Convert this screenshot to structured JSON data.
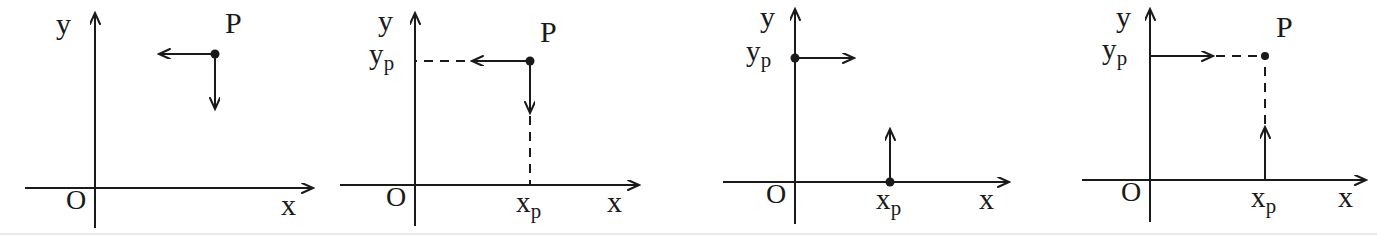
{
  "figure": {
    "background_color": "#ffffff",
    "stroke_color": "#1a1a1a",
    "panel_count": 4
  },
  "labels": {
    "x_axis": "x",
    "y_axis": "y",
    "origin": "O",
    "point": "P",
    "x_sub": "x",
    "x_sub_index": "p",
    "y_sub": "y",
    "y_sub_index": "p"
  },
  "panels": [
    {
      "id": "panel-1",
      "name": "point-p-with-component-arrows",
      "x_axis_label": "x",
      "y_axis_label": "y",
      "origin_label": "O",
      "point_label": "P",
      "has_x_projection_label": false,
      "has_y_projection_label": false,
      "arrows": [
        {
          "name": "leftward-arrow-from-p",
          "direction": "left",
          "style": "solid"
        },
        {
          "name": "downward-arrow-from-p",
          "direction": "down",
          "style": "solid"
        }
      ],
      "dot": {
        "name": "point-p-dot",
        "on": "free-point"
      }
    },
    {
      "id": "panel-2",
      "name": "point-p-projecting-onto-axes",
      "x_axis_label": "x",
      "y_axis_label": "y",
      "origin_label": "O",
      "point_label": "P",
      "x_projection_label": "x",
      "x_projection_sub": "p",
      "y_projection_label": "y",
      "y_projection_sub": "p",
      "has_x_projection_label": true,
      "has_y_projection_label": true,
      "arrows": [
        {
          "name": "leftward-arrow-to-y-axis",
          "direction": "left",
          "style": "solid-then-dashed"
        },
        {
          "name": "downward-arrow-to-x-axis",
          "direction": "down",
          "style": "solid-then-dashed"
        }
      ],
      "dot": {
        "name": "point-p-dot",
        "on": "free-point"
      }
    },
    {
      "id": "panel-3",
      "name": "axis-points-with-outward-arrows",
      "x_axis_label": "x",
      "y_axis_label": "y",
      "origin_label": "O",
      "x_projection_label": "x",
      "x_projection_sub": "p",
      "y_projection_label": "y",
      "y_projection_sub": "p",
      "has_x_projection_label": true,
      "has_y_projection_label": true,
      "has_point_label": false,
      "arrows": [
        {
          "name": "rightward-arrow-from-y-axis",
          "direction": "right",
          "style": "solid"
        },
        {
          "name": "upward-arrow-from-x-axis",
          "direction": "up",
          "style": "solid"
        }
      ],
      "dots": [
        {
          "name": "y-projection-dot",
          "on": "y-axis"
        },
        {
          "name": "x-projection-dot",
          "on": "x-axis"
        }
      ]
    },
    {
      "id": "panel-4",
      "name": "axis-projections-reconstructing-p",
      "x_axis_label": "x",
      "y_axis_label": "y",
      "origin_label": "O",
      "point_label": "P",
      "x_projection_label": "x",
      "x_projection_sub": "p",
      "y_projection_label": "y",
      "y_projection_sub": "p",
      "has_x_projection_label": true,
      "has_y_projection_label": true,
      "arrows": [
        {
          "name": "rightward-arrow-from-y-axis",
          "direction": "right",
          "style": "solid-then-dashed"
        },
        {
          "name": "upward-arrow-from-x-axis",
          "direction": "up",
          "style": "solid-then-dashed"
        }
      ],
      "dot": {
        "name": "point-p-dot",
        "on": "free-point"
      }
    }
  ]
}
